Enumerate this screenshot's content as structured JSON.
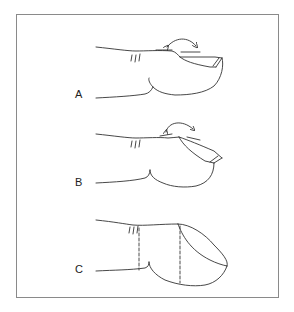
{
  "figure": {
    "panels": [
      {
        "label": "A",
        "description": "finger with nail in straight position; curved double-headed arrow above nail"
      },
      {
        "label": "B",
        "description": "finger with nail curving downward; curved double-headed arrow above nail"
      },
      {
        "label": "C",
        "description": "fingertip with curved nail; dashed vertical lines marking joint regions"
      }
    ],
    "colors": {
      "stroke": "#333333",
      "frame": "#8a8a8a",
      "background": "#ffffff"
    }
  }
}
